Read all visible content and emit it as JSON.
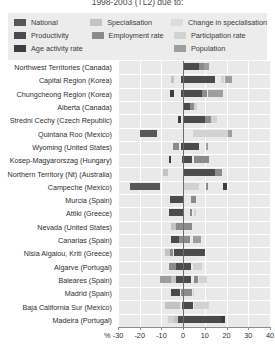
{
  "chart": {
    "title": "1998-2003 (TL2) due to:",
    "x_unit_symbol": "%"
  },
  "legend": {
    "rows": [
      [
        {
          "label": "National",
          "color": "#575757"
        },
        {
          "label": "Specialisation",
          "color": "#c3c3c4"
        },
        {
          "label": "Change in specialisation",
          "color": "#dcdcdd"
        }
      ],
      [
        {
          "label": "Productivity",
          "color": "#4b4b4b"
        },
        {
          "label": "Employment rate",
          "color": "#8b8b8c"
        },
        {
          "label": "Participation rate",
          "color": "#d2d2d3"
        }
      ],
      [
        {
          "label": "Age activity rate",
          "color": "#3d3d3d"
        },
        {
          "label": "",
          "color": ""
        },
        {
          "label": "Population",
          "color": "#9e9e9f"
        }
      ]
    ]
  },
  "chart_data": {
    "type": "bar",
    "orientation": "horizontal",
    "stacked": true,
    "title": "1998-2003 (TL2) due to:",
    "xlabel": "%",
    "ylabel": "",
    "xlim": [
      -30,
      40
    ],
    "xticks": [
      -30,
      -20,
      -10,
      0,
      10,
      20,
      30,
      40
    ],
    "xticklabels": [
      "-30",
      "-20",
      "-10",
      "0",
      "10",
      "20",
      "30",
      "40"
    ],
    "grid": true,
    "legend_position": "top",
    "series_order": [
      "National",
      "Specialisation",
      "Change in specialisation",
      "Productivity",
      "Employment rate",
      "Participation rate",
      "Age activity rate",
      "Population"
    ],
    "series_colors": {
      "National": "#575757",
      "Specialisation": "#c3c3c4",
      "Change in specialisation": "#dcdcdd",
      "Productivity": "#4b4b4b",
      "Employment rate": "#8b8b8c",
      "Participation rate": "#d2d2d3",
      "Age activity rate": "#3d3d3d",
      "Population": "#9e9e9f"
    },
    "categories": [
      "Northwest Territories (Canada)",
      "Capital Region (Korea)",
      "Chungcheong Region (Korea)",
      "Alberta (Canada)",
      "Stredni Cechy (Czech Republic)",
      "Quintana Roo (Mexico)",
      "Wyoming (United States)",
      "Kosep-Magyarorszag (Hungary)",
      "Northern Territory (Nt) (Australia)",
      "Campeche (Mexico)",
      "Murcia (Spain)",
      "Attiki (Greece)",
      "Nevada (United States)",
      "Canarias  (Spain)",
      "Nisia Aigaiou, Kriti (Greece)",
      "Algarve (Portugal)",
      "Baleares (Spain)",
      "Madrid (Spain)",
      "Baja California Sur (Mexico)",
      "Madeira (Portugal)"
    ],
    "bars": [
      {
        "category": "Northwest Territories (Canada)",
        "segments": [
          {
            "name": "Productivity",
            "start": 0.0,
            "value": 7.5
          },
          {
            "name": "Employment rate",
            "start": 7.5,
            "value": 2.0
          },
          {
            "name": "Population",
            "start": 9.5,
            "value": 2.5
          }
        ]
      },
      {
        "category": "Capital Region (Korea)",
        "segments": [
          {
            "name": "Specialisation",
            "start": -5.5,
            "value": 1.5
          },
          {
            "name": "Productivity",
            "start": -1.0,
            "value": 15.5
          },
          {
            "name": "Participation rate",
            "start": 17.5,
            "value": 1.5
          },
          {
            "name": "Population",
            "start": 19.5,
            "value": 3.0
          }
        ]
      },
      {
        "category": "Chungcheong Region (Korea)",
        "segments": [
          {
            "name": "Age activity rate",
            "start": -6.0,
            "value": 2.0
          },
          {
            "name": "Productivity",
            "start": -1.0,
            "value": 9.5
          },
          {
            "name": "Employment rate",
            "start": 8.5,
            "value": 2.5
          },
          {
            "name": "Population",
            "start": 11.5,
            "value": 7.0
          }
        ]
      },
      {
        "category": "Alberta (Canada)",
        "segments": [
          {
            "name": "Productivity",
            "start": 0.0,
            "value": 3.0
          },
          {
            "name": "Employment rate",
            "start": 3.0,
            "value": 2.0
          },
          {
            "name": "Participation rate",
            "start": 5.0,
            "value": 1.5
          }
        ]
      },
      {
        "category": "Stredni Cechy (Czech Republic)",
        "segments": [
          {
            "name": "Age activity rate",
            "start": -2.5,
            "value": 1.5
          },
          {
            "name": "Productivity",
            "start": 0.0,
            "value": 10.0
          },
          {
            "name": "Employment rate",
            "start": 10.0,
            "value": 3.0
          },
          {
            "name": "Participation rate",
            "start": 13.0,
            "value": 2.5
          }
        ]
      },
      {
        "category": "Quintana Roo (Mexico)",
        "segments": [
          {
            "name": "National",
            "start": -20.0,
            "value": 8.0
          },
          {
            "name": "Participation rate",
            "start": 4.5,
            "value": 16.0
          },
          {
            "name": "Population",
            "start": 20.5,
            "value": 2.0
          }
        ]
      },
      {
        "category": "Wyoming (United States)",
        "segments": [
          {
            "name": "Employment rate",
            "start": -4.5,
            "value": 2.5
          },
          {
            "name": "Productivity",
            "start": -1.0,
            "value": 8.5
          },
          {
            "name": "Population",
            "start": 10.5,
            "value": 1.0
          }
        ]
      },
      {
        "category": "Kosep-Magyarorszag (Hungary)",
        "segments": [
          {
            "name": "Age activity rate",
            "start": -6.5,
            "value": 1.0
          },
          {
            "name": "Productivity",
            "start": -0.5,
            "value": 4.5
          },
          {
            "name": "Employment rate",
            "start": 5.0,
            "value": 7.0
          }
        ]
      },
      {
        "category": "Northern Territory (Nt) (Australia)",
        "segments": [
          {
            "name": "Specialisation",
            "start": -9.5,
            "value": 2.5
          },
          {
            "name": "Productivity",
            "start": 0.5,
            "value": 14.0
          },
          {
            "name": "Employment rate",
            "start": 14.5,
            "value": 3.5
          }
        ]
      },
      {
        "category": "Campeche (Mexico)",
        "segments": [
          {
            "name": "National",
            "start": -24.5,
            "value": 14.0
          },
          {
            "name": "Participation rate",
            "start": 0.5,
            "value": 7.0
          },
          {
            "name": "Employment rate",
            "start": 10.5,
            "value": 1.0
          },
          {
            "name": "Age activity rate",
            "start": 18.5,
            "value": 1.5
          }
        ]
      },
      {
        "category": "Murcia (Spain)",
        "segments": [
          {
            "name": "Productivity",
            "start": -6.0,
            "value": 6.5
          },
          {
            "name": "Employment rate",
            "start": 3.5,
            "value": 2.5
          }
        ]
      },
      {
        "category": "Attiki (Greece)",
        "segments": [
          {
            "name": "Productivity",
            "start": -6.5,
            "value": 7.0
          },
          {
            "name": "Employment rate",
            "start": 3.0,
            "value": 1.0
          },
          {
            "name": "Participation rate",
            "start": 5.0,
            "value": 1.0
          }
        ]
      },
      {
        "category": "Nevada (United States)",
        "segments": [
          {
            "name": "Specialisation",
            "start": -5.5,
            "value": 2.0
          },
          {
            "name": "Employment rate",
            "start": -3.5,
            "value": 7.5
          }
        ]
      },
      {
        "category": "Canarias  (Spain)",
        "segments": [
          {
            "name": "Productivity",
            "start": -5.5,
            "value": 3.5
          },
          {
            "name": "Employment rate",
            "start": -2.0,
            "value": 5.0
          },
          {
            "name": "Population",
            "start": 4.5,
            "value": 3.5
          }
        ]
      },
      {
        "category": "Nisia Aigaiou, Kriti (Greece)",
        "segments": [
          {
            "name": "Specialisation",
            "start": -8.5,
            "value": 2.5
          },
          {
            "name": "Employment rate",
            "start": -6.0,
            "value": 1.5
          },
          {
            "name": "Productivity",
            "start": -4.0,
            "value": 14.0
          }
        ]
      },
      {
        "category": "Algarve (Portugal)",
        "segments": [
          {
            "name": "Employment rate",
            "start": -6.5,
            "value": 3.0
          },
          {
            "name": "Productivity",
            "start": -3.5,
            "value": 7.0
          },
          {
            "name": "Participation rate",
            "start": 4.5,
            "value": 4.0
          }
        ]
      },
      {
        "category": "Baleares (Spain)",
        "segments": [
          {
            "name": "Population",
            "start": -10.5,
            "value": 5.0
          },
          {
            "name": "Specialisation",
            "start": -5.5,
            "value": 2.0
          },
          {
            "name": "Productivity",
            "start": -3.5,
            "value": 7.0
          },
          {
            "name": "Employment rate",
            "start": 5.0,
            "value": 2.0
          },
          {
            "name": "Participation rate",
            "start": 7.5,
            "value": 3.5
          }
        ]
      },
      {
        "category": "Madrid (Spain)",
        "segments": [
          {
            "name": "Productivity",
            "start": -5.5,
            "value": 4.0
          },
          {
            "name": "Employment rate",
            "start": -1.0,
            "value": 5.0
          },
          {
            "name": "Participation rate",
            "start": 4.5,
            "value": 0.5
          }
        ]
      },
      {
        "category": "Baja California Sur (Mexico)",
        "segments": [
          {
            "name": "Specialisation",
            "start": -8.5,
            "value": 7.0
          },
          {
            "name": "Productivity",
            "start": -0.5,
            "value": 5.0
          },
          {
            "name": "Participation rate",
            "start": 5.0,
            "value": 7.0
          }
        ]
      },
      {
        "category": "Madeira (Portugal)",
        "segments": [
          {
            "name": "Participation rate",
            "start": -7.0,
            "value": 3.0
          },
          {
            "name": "Specialisation",
            "start": -4.0,
            "value": 1.5
          },
          {
            "name": "Productivity",
            "start": -2.5,
            "value": 20.0
          },
          {
            "name": "Age activity rate",
            "start": 17.5,
            "value": 2.0
          }
        ]
      }
    ]
  }
}
